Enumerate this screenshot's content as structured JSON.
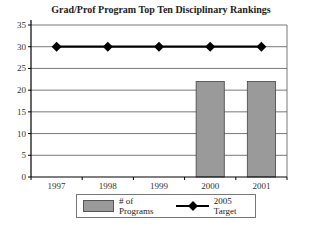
{
  "chart_data": {
    "type": "bar",
    "title": "Grad/Prof Program Top Ten Disciplinary Rankings",
    "categories": [
      "1997",
      "1998",
      "1999",
      "2000",
      "2001"
    ],
    "series": [
      {
        "name": "# of Programs",
        "type": "bar",
        "values": [
          null,
          null,
          null,
          22,
          22
        ],
        "color": "#9a9a9a"
      },
      {
        "name": "2005 Target",
        "type": "line",
        "values": [
          30,
          30,
          30,
          30,
          30
        ],
        "color": "#000000",
        "marker": "diamond"
      }
    ],
    "xlabel": "",
    "ylabel": "",
    "ylim": [
      0,
      35
    ],
    "yticks": [
      0,
      5,
      10,
      15,
      20,
      25,
      30,
      35
    ],
    "grid": true,
    "legend_position": "bottom"
  },
  "legend": {
    "bar_label": "# of Programs",
    "line_label": "2005 Target"
  }
}
